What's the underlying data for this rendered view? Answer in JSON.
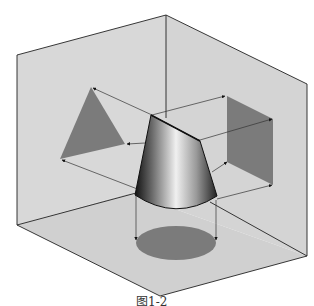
{
  "diagram": {
    "colors": {
      "background": "#ffffff",
      "plane_fill": "#d9d9d9",
      "plane_edge": "#222222",
      "projection_fill": "#7b7b7b",
      "projection_line": "#333333",
      "cone_dark": "#1a1a1a",
      "cone_light": "#f2f2f2"
    },
    "planes": {
      "left_wall": {
        "label": "left vertical plane",
        "points": "17,55 166,15 166,115 130,193 17,225"
      },
      "right_wall": {
        "label": "right vertical plane",
        "points": "166,15 307,84 307,256 130,193 166,115"
      },
      "floor": {
        "label": "horizontal plane",
        "points": "17,225 130,193 307,256 160,296"
      }
    },
    "projections": {
      "triangle": {
        "label": "side view (triangle)",
        "points": "91,87 125,144 60,159"
      },
      "square": {
        "label": "front view (rectangle)",
        "points": "227,96 273,119 273,185 227,162"
      },
      "ellipse": {
        "label": "top view (circle)",
        "cx": 176,
        "cy": 243,
        "rx": 40,
        "ry": 17
      }
    },
    "caption": "图1-2"
  }
}
